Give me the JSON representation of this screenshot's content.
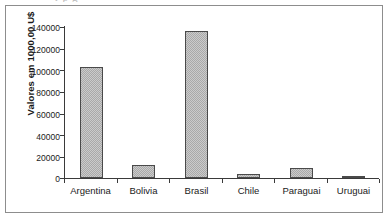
{
  "figure": {
    "clipped_caption_above": "r p         g"
  },
  "chart_data": {
    "type": "bar",
    "title": "",
    "xlabel": "",
    "ylabel": "Valores em 1000,00 U$",
    "categories": [
      "Argentina",
      "Bolivia",
      "Brasil",
      "Chile",
      "Paraguai",
      "Uruguai"
    ],
    "values": [
      102500,
      12300,
      135500,
      3700,
      9500,
      1400
    ],
    "ylim": [
      0,
      140000
    ],
    "ytick_labels": [
      "0",
      "20000",
      "40000",
      "60000",
      "80000",
      "100000",
      "120000",
      "140000"
    ],
    "ytick_values": [
      0,
      20000,
      40000,
      60000,
      80000,
      100000,
      120000,
      140000
    ],
    "grid": false,
    "legend": false,
    "bar_fill_color": "#a9a9a9",
    "bar_border_color": "#4a4a4a",
    "axis_color": "#3a3a3a",
    "frame_color": "#8d8d8d",
    "background_color": "#ffffff"
  }
}
